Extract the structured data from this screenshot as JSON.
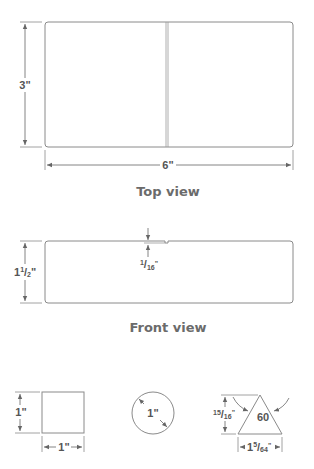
{
  "top_view": {
    "caption": "Top view",
    "height_label": "3\"",
    "width_label": "6\""
  },
  "front_view": {
    "caption": "Front view",
    "height_label_whole": "1",
    "height_label_num": "1",
    "height_label_den": "2",
    "height_label_unit": "\"",
    "notch_label_num": "1",
    "notch_label_den": "16",
    "notch_label_unit": "\""
  },
  "square": {
    "height_label": "1\"",
    "width_label": "1\""
  },
  "circle": {
    "diameter_label": "1\""
  },
  "triangle": {
    "angle_label": "60",
    "height_label_num": "15",
    "height_label_den": "16",
    "height_label_unit": "\"",
    "base_label_whole": "1",
    "base_label_num": "5",
    "base_label_den": "64",
    "base_label_unit": "\""
  },
  "colors": {
    "line": "#8a8a8a",
    "text": "#555555",
    "caption": "#6b6b6b"
  }
}
